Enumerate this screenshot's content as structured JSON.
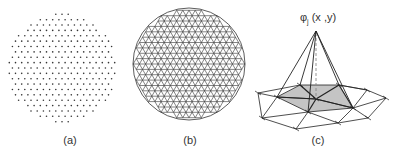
{
  "panels": [
    {
      "id": "a",
      "label": "(a)",
      "description": "point cloud in a disk",
      "center": [
        62,
        68
      ],
      "radius": 55
    },
    {
      "id": "b",
      "label": "(b)",
      "description": "triangulated mesh of disk",
      "center": [
        189,
        64
      ],
      "radius": 56
    },
    {
      "id": "c",
      "label": "(c)",
      "description": "hat basis function over triangle patch"
    }
  ],
  "basis_label": {
    "phi": "φ",
    "sub": "j",
    "args": " (x ,y)"
  },
  "colors": {
    "ink": "#222222",
    "dot": "#333333",
    "shade": "#c4c4c4",
    "dash": "#888888"
  }
}
